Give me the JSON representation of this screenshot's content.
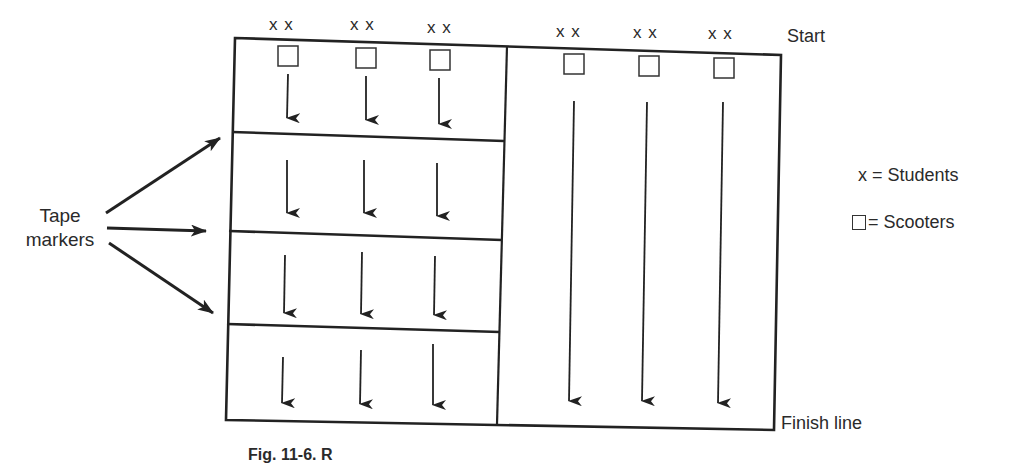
{
  "diagram": {
    "type": "scooter-relay-layout",
    "labels": {
      "start": "Start",
      "finish": "Finish line",
      "tape_line1": "Tape",
      "tape_line2": "markers",
      "caption": "Fig. 11-6. R"
    },
    "legend": {
      "students_symbol": "x",
      "students_text": "= Students",
      "scooters_text": "= Scooters"
    },
    "student_marker": "x x",
    "left_section": {
      "lanes": 3,
      "segments": 4,
      "lane_x": [
        288,
        366,
        440
      ],
      "student_labels": [
        "x x",
        "x x",
        "x x"
      ],
      "description": "Shuttle lanes divided by tape markers into 4 segments"
    },
    "right_section": {
      "lanes": 3,
      "lane_x": [
        573,
        649,
        723
      ],
      "student_labels": [
        "x x",
        "x x",
        "x x"
      ],
      "description": "Straight lanes from start to finish line"
    },
    "tape_marker_arrows": 3,
    "colors": {
      "line": "#222222",
      "background": "#ffffff",
      "text": "#2a2a2a"
    }
  }
}
